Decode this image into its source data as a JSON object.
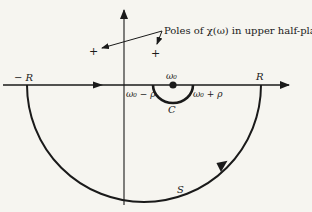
{
  "diagram": {
    "colors": {
      "background": "#f6f5f0",
      "ink": "#1a1a1a"
    },
    "labels": {
      "annotation": "Poles of χ(ω) in upper half-plane",
      "neg_R": "− R",
      "pos_R": "R",
      "omega0": "ω₀",
      "omega0_minus_rho": "ω₀ − ρ",
      "omega0_plus_rho": "ω₀ + ρ",
      "C": "C",
      "S": "S",
      "pole_marker": "+"
    },
    "elements": {
      "real_axis": {
        "from": [
          3,
          85
        ],
        "to": [
          289,
          85
        ]
      },
      "imag_axis": {
        "from": [
          124,
          205
        ],
        "to": [
          124,
          7
        ]
      },
      "large_semicircle_S": {
        "center": [
          144,
          85
        ],
        "radius": 117
      },
      "small_semicircle_C": {
        "center": [
          173,
          85
        ],
        "radius": 20
      },
      "poles": [
        [
          93,
          50
        ],
        [
          155,
          52
        ]
      ],
      "omega0_point": [
        173,
        85
      ]
    }
  }
}
